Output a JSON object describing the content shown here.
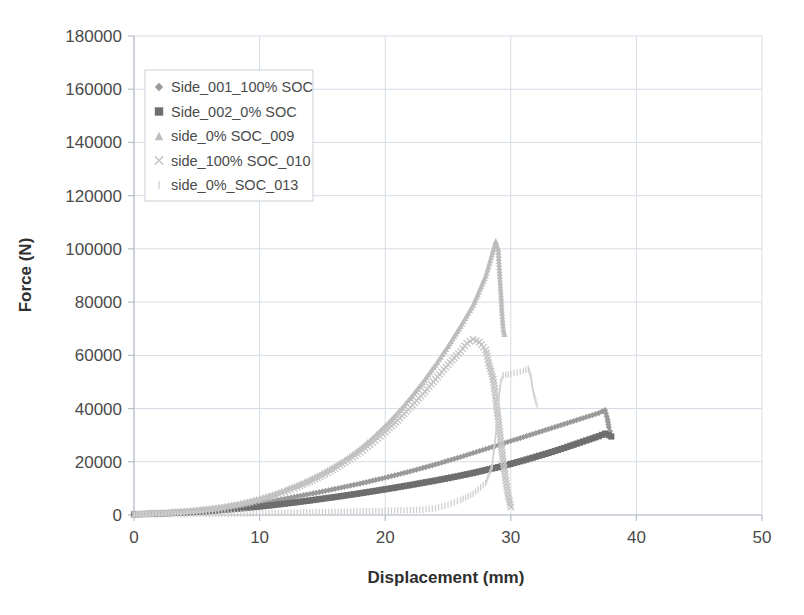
{
  "chart_data": {
    "type": "scatter",
    "title": "",
    "xlabel": "Displacement (mm)",
    "ylabel": "Force (N)",
    "xlim": [
      0,
      50
    ],
    "ylim": [
      0,
      180000
    ],
    "xticks": [
      0,
      10,
      20,
      30,
      40,
      50
    ],
    "yticks": [
      0,
      20000,
      40000,
      60000,
      80000,
      100000,
      120000,
      140000,
      160000,
      180000
    ],
    "xtick_labels": [
      "0",
      "10",
      "20",
      "30",
      "40",
      "50"
    ],
    "ytick_labels": [
      "0",
      "20000",
      "40000",
      "60000",
      "80000",
      "100000",
      "120000",
      "140000",
      "160000",
      "180000"
    ],
    "grid": true,
    "legend_position": "upper-left",
    "series": [
      {
        "name": "Side_001_100% SOC",
        "marker": "diamond",
        "color": "#9a9a9a",
        "points": [
          [
            0,
            300
          ],
          [
            0.5,
            400
          ],
          [
            1,
            500
          ],
          [
            1.5,
            600
          ],
          [
            2,
            700
          ],
          [
            2.5,
            800
          ],
          [
            3,
            950
          ],
          [
            3.5,
            1100
          ],
          [
            4,
            1250
          ],
          [
            4.5,
            1400
          ],
          [
            5,
            1600
          ],
          [
            5.5,
            1800
          ],
          [
            6,
            2000
          ],
          [
            6.5,
            2250
          ],
          [
            7,
            2500
          ],
          [
            7.5,
            2800
          ],
          [
            8,
            3100
          ],
          [
            8.5,
            3450
          ],
          [
            9,
            3800
          ],
          [
            9.5,
            4150
          ],
          [
            10,
            4500
          ],
          [
            11,
            5300
          ],
          [
            12,
            6100
          ],
          [
            13,
            7000
          ],
          [
            14,
            7900
          ],
          [
            15,
            8800
          ],
          [
            16,
            9800
          ],
          [
            17,
            10800
          ],
          [
            18,
            11800
          ],
          [
            19,
            12900
          ],
          [
            20,
            14000
          ],
          [
            21,
            15200
          ],
          [
            22,
            16400
          ],
          [
            23,
            17700
          ],
          [
            24,
            19000
          ],
          [
            25,
            20400
          ],
          [
            26,
            21800
          ],
          [
            27,
            23300
          ],
          [
            28,
            24800
          ],
          [
            29,
            26300
          ],
          [
            30,
            27800
          ],
          [
            31,
            29300
          ],
          [
            32,
            30800
          ],
          [
            33,
            32300
          ],
          [
            34,
            33800
          ],
          [
            35,
            35300
          ],
          [
            36,
            36800
          ],
          [
            37,
            38300
          ],
          [
            37.5,
            39400
          ],
          [
            37.7,
            36000
          ],
          [
            37.8,
            33000
          ],
          [
            37.9,
            31500
          ]
        ]
      },
      {
        "name": "Side_002_0% SOC",
        "marker": "square",
        "color": "#6e6e6e",
        "points": [
          [
            0,
            250
          ],
          [
            0.5,
            320
          ],
          [
            1,
            400
          ],
          [
            1.5,
            470
          ],
          [
            2,
            550
          ],
          [
            2.5,
            640
          ],
          [
            3,
            740
          ],
          [
            3.5,
            850
          ],
          [
            4,
            960
          ],
          [
            4.5,
            1080
          ],
          [
            5,
            1200
          ],
          [
            5.5,
            1350
          ],
          [
            6,
            1500
          ],
          [
            6.5,
            1680
          ],
          [
            7,
            1860
          ],
          [
            7.5,
            2060
          ],
          [
            8,
            2260
          ],
          [
            8.5,
            2480
          ],
          [
            9,
            2700
          ],
          [
            9.5,
            2940
          ],
          [
            10,
            3180
          ],
          [
            11,
            3700
          ],
          [
            12,
            4250
          ],
          [
            13,
            4850
          ],
          [
            14,
            5450
          ],
          [
            15,
            6100
          ],
          [
            16,
            6750
          ],
          [
            17,
            7450
          ],
          [
            18,
            8150
          ],
          [
            19,
            8900
          ],
          [
            20,
            9650
          ],
          [
            21,
            10450
          ],
          [
            22,
            11250
          ],
          [
            23,
            12100
          ],
          [
            24,
            12950
          ],
          [
            25,
            13850
          ],
          [
            26,
            14800
          ],
          [
            27,
            15800
          ],
          [
            28,
            16900
          ],
          [
            29,
            18000
          ],
          [
            30,
            19200
          ],
          [
            31,
            20500
          ],
          [
            32,
            21900
          ],
          [
            33,
            23300
          ],
          [
            34,
            24800
          ],
          [
            35,
            26400
          ],
          [
            36,
            28000
          ],
          [
            37,
            29600
          ],
          [
            37.5,
            30600
          ],
          [
            37.8,
            30000
          ],
          [
            38,
            29500
          ]
        ]
      },
      {
        "name": "side_0% SOC_009",
        "marker": "triangle",
        "color": "#bdbdbd",
        "points": [
          [
            0,
            300
          ],
          [
            0.5,
            420
          ],
          [
            1,
            540
          ],
          [
            1.5,
            660
          ],
          [
            2,
            790
          ],
          [
            2.5,
            930
          ],
          [
            3,
            1080
          ],
          [
            3.5,
            1250
          ],
          [
            4,
            1430
          ],
          [
            4.5,
            1630
          ],
          [
            5,
            1850
          ],
          [
            5.5,
            2100
          ],
          [
            6,
            2380
          ],
          [
            6.5,
            2700
          ],
          [
            7,
            3050
          ],
          [
            7.5,
            3450
          ],
          [
            8,
            3900
          ],
          [
            8.5,
            4400
          ],
          [
            9,
            4950
          ],
          [
            9.5,
            5550
          ],
          [
            10,
            6200
          ],
          [
            11,
            7700
          ],
          [
            12,
            9400
          ],
          [
            13,
            11300
          ],
          [
            14,
            13400
          ],
          [
            15,
            15800
          ],
          [
            16,
            18500
          ],
          [
            17,
            21500
          ],
          [
            18,
            25000
          ],
          [
            19,
            29000
          ],
          [
            20,
            33500
          ],
          [
            21,
            38500
          ],
          [
            22,
            44000
          ],
          [
            23,
            50000
          ],
          [
            24,
            56500
          ],
          [
            25,
            63500
          ],
          [
            26,
            71000
          ],
          [
            27,
            79000
          ],
          [
            28,
            90000
          ],
          [
            28.5,
            98000
          ],
          [
            28.8,
            103000
          ],
          [
            29,
            100000
          ],
          [
            29.1,
            92000
          ],
          [
            29.2,
            84000
          ],
          [
            29.3,
            76000
          ],
          [
            29.4,
            70000
          ],
          [
            29.5,
            68000
          ]
        ]
      },
      {
        "name": "side_100% SOC_010",
        "marker": "cross",
        "color": "#c4c4c4",
        "points": [
          [
            0,
            280
          ],
          [
            0.5,
            380
          ],
          [
            1,
            480
          ],
          [
            1.5,
            590
          ],
          [
            2,
            700
          ],
          [
            2.5,
            830
          ],
          [
            3,
            970
          ],
          [
            3.5,
            1120
          ],
          [
            4,
            1290
          ],
          [
            4.5,
            1470
          ],
          [
            5,
            1670
          ],
          [
            5.5,
            1900
          ],
          [
            6,
            2150
          ],
          [
            6.5,
            2450
          ],
          [
            7,
            2780
          ],
          [
            7.5,
            3150
          ],
          [
            8,
            3560
          ],
          [
            8.5,
            4020
          ],
          [
            9,
            4520
          ],
          [
            9.5,
            5080
          ],
          [
            10,
            5700
          ],
          [
            11,
            7100
          ],
          [
            12,
            8700
          ],
          [
            13,
            10500
          ],
          [
            14,
            12600
          ],
          [
            15,
            14900
          ],
          [
            16,
            17500
          ],
          [
            17,
            20400
          ],
          [
            18,
            23600
          ],
          [
            19,
            27200
          ],
          [
            20,
            31200
          ],
          [
            21,
            35600
          ],
          [
            22,
            40500
          ],
          [
            23,
            45500
          ],
          [
            24,
            51000
          ],
          [
            25,
            56500
          ],
          [
            26,
            61500
          ],
          [
            26.5,
            64500
          ],
          [
            27,
            66000
          ],
          [
            27.5,
            65000
          ],
          [
            28,
            62000
          ],
          [
            28.3,
            56000
          ],
          [
            28.6,
            51000
          ],
          [
            28.8,
            44000
          ],
          [
            29,
            36000
          ],
          [
            29.2,
            28000
          ],
          [
            29.4,
            20000
          ],
          [
            29.6,
            13000
          ],
          [
            29.8,
            7000
          ],
          [
            30,
            3000
          ]
        ]
      },
      {
        "name": "side_0%_SOC_013",
        "marker": "bar",
        "color": "#cfcfcf",
        "points": [
          [
            0,
            150
          ],
          [
            1,
            180
          ],
          [
            2,
            220
          ],
          [
            3,
            260
          ],
          [
            4,
            300
          ],
          [
            5,
            350
          ],
          [
            6,
            400
          ],
          [
            7,
            460
          ],
          [
            8,
            520
          ],
          [
            9,
            590
          ],
          [
            10,
            660
          ],
          [
            11,
            740
          ],
          [
            12,
            820
          ],
          [
            13,
            900
          ],
          [
            14,
            980
          ],
          [
            15,
            1060
          ],
          [
            16,
            1150
          ],
          [
            17,
            1250
          ],
          [
            18,
            1350
          ],
          [
            19,
            1450
          ],
          [
            20,
            1550
          ],
          [
            21,
            1680
          ],
          [
            22,
            1820
          ],
          [
            23,
            2000
          ],
          [
            24,
            2600
          ],
          [
            25,
            3800
          ],
          [
            26,
            5600
          ],
          [
            27,
            8000
          ],
          [
            28,
            12000
          ],
          [
            28.5,
            18000
          ],
          [
            28.8,
            30000
          ],
          [
            29,
            42000
          ],
          [
            29.2,
            50000
          ],
          [
            29.4,
            52500
          ],
          [
            30,
            53000
          ],
          [
            30.5,
            53500
          ],
          [
            31,
            54200
          ],
          [
            31.4,
            55000
          ],
          [
            31.6,
            52000
          ],
          [
            31.8,
            46000
          ],
          [
            32,
            42500
          ],
          [
            32.1,
            41000
          ]
        ]
      }
    ]
  }
}
